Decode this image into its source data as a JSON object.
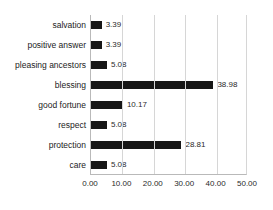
{
  "chart_data": {
    "type": "bar",
    "orientation": "horizontal",
    "title": "",
    "xlabel": "",
    "ylabel": "",
    "xlim": [
      0,
      50
    ],
    "xticks": [
      "0.00",
      "10.00",
      "20.00",
      "30.00",
      "40.00",
      "50.00"
    ],
    "xtick_values": [
      0,
      10,
      20,
      30,
      40,
      50
    ],
    "grid": "vertical",
    "legend": "none",
    "bar_color": "#161616",
    "categories": [
      "salvation",
      "positive answer",
      "pleasing ancestors",
      "blessing",
      "good fortune",
      "respect",
      "protection",
      "care"
    ],
    "values": [
      3.39,
      3.39,
      5.08,
      38.98,
      10.17,
      5.08,
      28.81,
      5.08
    ],
    "value_labels": [
      "3.39",
      "3.39",
      "5.08",
      "38.98",
      "10.17",
      "5.08",
      "28.81",
      "5.08"
    ]
  }
}
